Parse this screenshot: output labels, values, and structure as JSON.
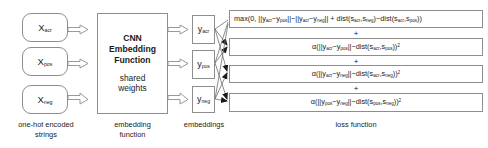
{
  "inputs": {
    "boxes": [
      {
        "name": "anchor",
        "base": "X",
        "sub": "acr"
      },
      {
        "name": "positive",
        "base": "X",
        "sub": "pos"
      },
      {
        "name": "negative",
        "base": "X",
        "sub": "neg"
      }
    ],
    "caption_line1": "one-hot encoded",
    "caption_line2": "strings"
  },
  "network": {
    "title_line1": "CNN",
    "title_line2": "Embedding",
    "title_line3": "Function",
    "sub_line1": "shared",
    "sub_line2": "weights",
    "caption_line1": "embedding",
    "caption_line2": "function"
  },
  "embeddings": {
    "boxes": [
      {
        "name": "anchor",
        "base": "y",
        "sub": "acr"
      },
      {
        "name": "positive",
        "base": "y",
        "sub": "pos"
      },
      {
        "name": "negative",
        "base": "y",
        "sub": "neg"
      }
    ],
    "caption": "embeddings"
  },
  "loss": {
    "caption": "loss function",
    "separator": "+",
    "terms": [
      {
        "id": "triplet-margin-term",
        "parts": [
          {
            "t": "max(0, ||"
          },
          {
            "t": "y",
            "sub": "acr"
          },
          {
            "t": "−"
          },
          {
            "t": "y",
            "sub": "pos"
          },
          {
            "t": "||−||"
          },
          {
            "t": "y",
            "sub": "acr"
          },
          {
            "t": "−"
          },
          {
            "t": "y",
            "sub": "neg"
          },
          {
            "t": "|| + dist("
          },
          {
            "t": "s",
            "sub": "acr"
          },
          {
            "t": ","
          },
          {
            "t": "s",
            "sub": "neg"
          },
          {
            "t": ")−dist("
          },
          {
            "t": "s",
            "sub": "acr"
          },
          {
            "t": ","
          },
          {
            "t": "s",
            "sub": "pos"
          },
          {
            "t": "))"
          }
        ]
      },
      {
        "id": "anchor-positive-regression-term",
        "parts": [
          {
            "t": "α(||"
          },
          {
            "t": "y",
            "sub": "acr"
          },
          {
            "t": "−"
          },
          {
            "t": "y",
            "sub": "pos"
          },
          {
            "t": "||−dist("
          },
          {
            "t": "s",
            "sub": "acr"
          },
          {
            "t": ","
          },
          {
            "t": "s",
            "sub": "pos"
          },
          {
            "t": "))"
          },
          {
            "t": "",
            "sup": "2"
          }
        ]
      },
      {
        "id": "anchor-negative-regression-term",
        "parts": [
          {
            "t": "α(||"
          },
          {
            "t": "y",
            "sub": "acr"
          },
          {
            "t": "−"
          },
          {
            "t": "y",
            "sub": "neg"
          },
          {
            "t": "||−dist("
          },
          {
            "t": "s",
            "sub": "acr"
          },
          {
            "t": ","
          },
          {
            "t": "s",
            "sub": "neg"
          },
          {
            "t": "))"
          },
          {
            "t": "",
            "sup": "2"
          }
        ]
      },
      {
        "id": "positive-negative-regression-term",
        "parts": [
          {
            "t": "α(||"
          },
          {
            "t": "y",
            "sub": "pos"
          },
          {
            "t": "−"
          },
          {
            "t": "y",
            "sub": "neg"
          },
          {
            "t": "||−dist("
          },
          {
            "t": "s",
            "sub": "pos"
          },
          {
            "t": ","
          },
          {
            "t": "s",
            "sub": "neg"
          },
          {
            "t": "))"
          },
          {
            "t": "",
            "sup": "2"
          }
        ]
      }
    ]
  },
  "style": {
    "stroke": "#8e8e8e",
    "wire": "#6f6f6f",
    "arrow_fill": "#ffffff"
  }
}
